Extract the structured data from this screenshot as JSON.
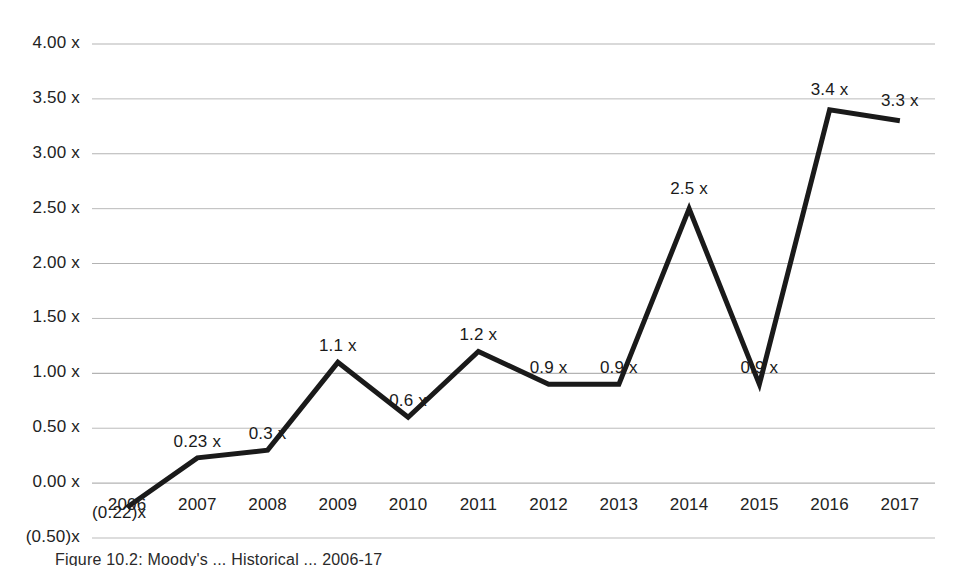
{
  "chart_data": {
    "type": "line",
    "title": "",
    "subtitle": "",
    "xlabel": "",
    "ylabel": "",
    "grid": true,
    "legend": "none",
    "categories": [
      "2006",
      "2007",
      "2008",
      "2009",
      "2010",
      "2011",
      "2012",
      "2013",
      "2014",
      "2015",
      "2016",
      "2017"
    ],
    "values": [
      -0.22,
      0.23,
      0.3,
      1.1,
      0.6,
      1.2,
      0.9,
      0.9,
      2.5,
      0.9,
      3.4,
      3.3
    ],
    "point_labels": [
      "(0.22)x",
      "0.23 x",
      "0.3 x",
      "1.1 x",
      "0.6 x",
      "1.2 x",
      "0.9 x",
      "0.9 x",
      "2.5 x",
      "0.9 x",
      "3.4 x",
      "3.3 x"
    ],
    "ylim": [
      -0.5,
      4.0
    ],
    "ytick_values": [
      4.0,
      3.5,
      3.0,
      2.5,
      2.0,
      1.5,
      1.0,
      0.5,
      0.0,
      -0.5
    ],
    "ytick_labels": [
      "4.00 x",
      "3.50 x",
      "3.00 x",
      "2.50 x",
      "2.00 x",
      "1.50 x",
      "1.00 x",
      "0.50 x",
      "0.00 x",
      "(0.50)x"
    ],
    "series_color": "#1a1a1a",
    "grid_color": "#b3b3b3",
    "background": "#ffffff"
  },
  "caption": {
    "text": "Figure 10.2: Moody's ... Historical ... 2006-17"
  }
}
